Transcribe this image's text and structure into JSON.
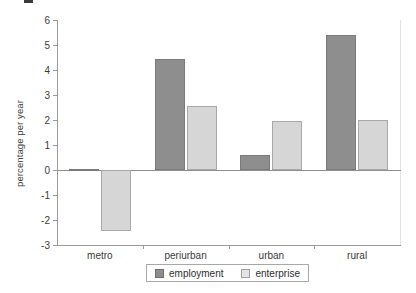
{
  "chart_data": {
    "type": "bar",
    "title": "",
    "xlabel": "",
    "ylabel": "percentage per year",
    "categories": [
      "metro",
      "periurban",
      "urban",
      "rural"
    ],
    "series": [
      {
        "name": "employment",
        "color": "#8e8e8e",
        "values": [
          0.05,
          4.45,
          0.6,
          5.4
        ]
      },
      {
        "name": "enterprise",
        "color": "#d6d6d6",
        "values": [
          -2.45,
          2.55,
          1.95,
          2.0
        ]
      }
    ],
    "ylim": [
      -3,
      6
    ],
    "yticks": [
      6,
      5,
      4,
      3,
      2,
      1,
      0,
      -1,
      -2,
      -3
    ],
    "ytick_labels": [
      "6",
      "5",
      "4",
      "3",
      "2",
      "1",
      "0",
      "-1",
      "-2",
      "-3"
    ],
    "grid": false,
    "legend_position": "bottom-center",
    "zero_line": true
  },
  "legend": {
    "items": [
      {
        "label": "employment",
        "swatch": "employment-swatch"
      },
      {
        "label": "enterprise",
        "swatch": "enterprise-swatch"
      }
    ]
  }
}
